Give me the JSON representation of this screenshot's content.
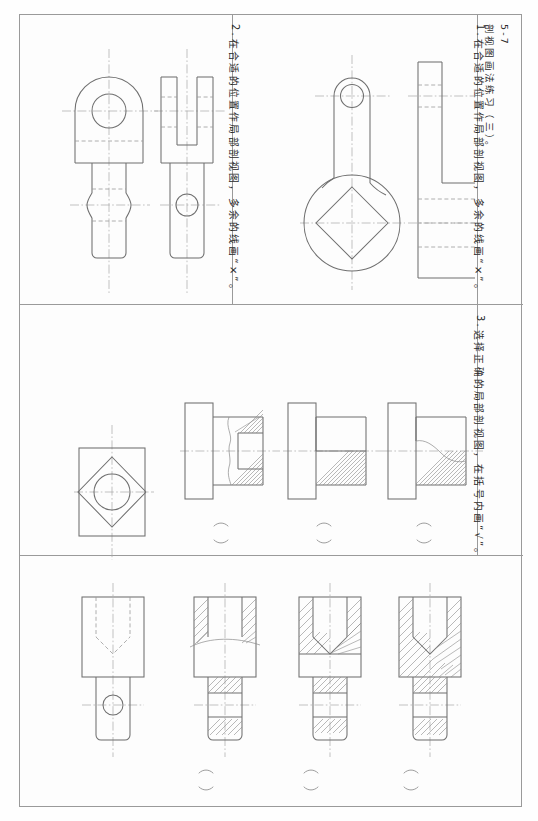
{
  "sheet": {
    "title_code": "5-7",
    "title_text": "剖视图画法练习（三）。",
    "bg_color": "#fefefe",
    "line_color": "#6f6f6f",
    "frame_color": "#9a9a9a"
  },
  "items": [
    {
      "number": "1.",
      "text": "在合适的位置作局部剖视图，多余的线画“×”。",
      "panel": "top-right"
    },
    {
      "number": "2.",
      "text": "在合适的位置作局部剖视图，多余的线画“×”。",
      "panel": "top-left"
    },
    {
      "number": "3.",
      "text": "选择正确的局部剖视图，在括号内画“√”。",
      "panel": "middle-and-bottom"
    }
  ],
  "panels": {
    "item1": {
      "name": "crank-lever-two-views",
      "front_view": "crank with small bore at top and large boss with square hole at bottom",
      "side_view": "stepped L-shaped profile with hidden lines"
    },
    "item2": {
      "name": "clevis-fork-two-views",
      "front_view": "rounded head with bore over necked shank",
      "side_view": "forked slot with cross bore in shank"
    },
    "item3_row1": {
      "name": "square-flange-bush",
      "given_view": "square plate with diamond and circular bore",
      "options": [
        {
          "label": "option-a",
          "marker": "(   )",
          "desc": "partial section with wavy break at boss"
        },
        {
          "label": "option-b",
          "marker": "(   )",
          "desc": "half lower section, straight split"
        },
        {
          "label": "option-c",
          "marker": "(   )",
          "desc": "partial section with long wavy break"
        }
      ]
    },
    "item3_row2": {
      "name": "stepped-pin-with-blind-hole",
      "given_view": "outline view with hidden blind conical hole and cross bore",
      "options": [
        {
          "label": "option-a",
          "marker": "(   )",
          "desc": "local section top with break line, hatched shank bands"
        },
        {
          "label": "option-b",
          "marker": "(   )",
          "desc": "local section with straight split and hatched shank"
        },
        {
          "label": "option-c",
          "marker": "(   )",
          "desc": "full section fully hatched"
        }
      ]
    }
  },
  "answer_brackets": {
    "glyph_left": "(",
    "glyph_right": ")",
    "count_row1": 3,
    "count_row2": 3
  }
}
